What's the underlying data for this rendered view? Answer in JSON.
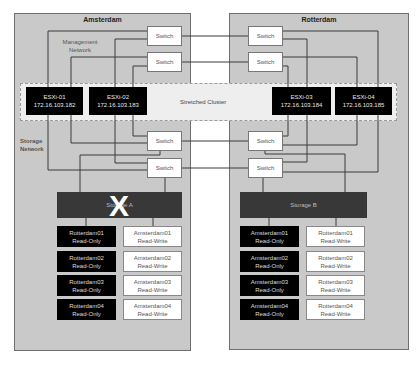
{
  "sites": {
    "amsterdam": {
      "title": "Amsterdam",
      "management_label_line1": "Management",
      "management_label_line2": "Network",
      "storage_label_line1": "Storage",
      "storage_label_line2": "Network",
      "switches": [
        "Switch",
        "Switch",
        "Switch",
        "Switch"
      ],
      "storage": {
        "label": "Storage A",
        "status": "failed",
        "failure_mark": "X"
      },
      "datastores": [
        {
          "name": "Rotterdam01",
          "mode": "Read-Only"
        },
        {
          "name": "Amsterdam01",
          "mode": "Read-Write"
        },
        {
          "name": "Rotterdam02",
          "mode": "Read-Only"
        },
        {
          "name": "Amsterdam02",
          "mode": "Read-Write"
        },
        {
          "name": "Rotterdam03",
          "mode": "Read-Only"
        },
        {
          "name": "Amsterdam03",
          "mode": "Read-Write"
        },
        {
          "name": "Rotterdam04",
          "mode": "Read-Only"
        },
        {
          "name": "Amsterdam04",
          "mode": "Read-Write"
        }
      ]
    },
    "rotterdam": {
      "title": "Rotterdam",
      "switches": [
        "Switch",
        "Switch",
        "Switch",
        "Switch"
      ],
      "storage": {
        "label": "Storage B"
      },
      "datastores": [
        {
          "name": "Amsterdam01",
          "mode": "Read-Only"
        },
        {
          "name": "Rotterdam01",
          "mode": "Read-Write"
        },
        {
          "name": "Amsterdam02",
          "mode": "Read-Only"
        },
        {
          "name": "Rotterdam02",
          "mode": "Read-Write"
        },
        {
          "name": "Amsterdam03",
          "mode": "Read-Only"
        },
        {
          "name": "Rotterdam03",
          "mode": "Read-Write"
        },
        {
          "name": "Amsterdam04",
          "mode": "Read-Only"
        },
        {
          "name": "Rotterdam04",
          "mode": "Read-Write"
        }
      ]
    }
  },
  "cluster": {
    "label": "Stretched Cluster",
    "hosts": [
      {
        "name": "ESXi-01",
        "ip": "172.16.103.182"
      },
      {
        "name": "ESXi-02",
        "ip": "172.16.103.183"
      },
      {
        "name": "ESXi-03",
        "ip": "172.16.103.184"
      },
      {
        "name": "ESXi-04",
        "ip": "172.16.103.185"
      }
    ]
  },
  "colors": {
    "site_bg": "#c9c9c9",
    "host_bg": "#000000",
    "storage_bg": "#383838",
    "line": "#3a3a3a"
  }
}
